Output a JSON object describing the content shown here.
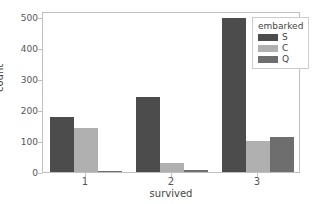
{
  "chart_data": {
    "type": "bar",
    "title": "",
    "xlabel": "survived",
    "ylabel": "count",
    "categories": [
      "1",
      "2",
      "3"
    ],
    "series": [
      {
        "name": "S",
        "color": "#4c4c4c",
        "values": [
          178,
          242,
          496
        ]
      },
      {
        "name": "C",
        "color": "#b0b0b0",
        "values": [
          141,
          29,
          100
        ]
      },
      {
        "name": "Q",
        "color": "#6e6e6e",
        "values": [
          3,
          7,
          112
        ]
      }
    ],
    "legend": {
      "title": "embarked",
      "position": "upper right",
      "entries": [
        "S",
        "C",
        "Q"
      ]
    },
    "ylim": [
      0,
      520
    ],
    "yticks": [
      0,
      100,
      200,
      300,
      400,
      500
    ],
    "ytick_labels": [
      "0",
      "100",
      "200",
      "300",
      "400",
      "500"
    ],
    "xtick_labels": [
      "1",
      "2",
      "3"
    ],
    "grid": false,
    "axes_color": "#bfbfbf",
    "background": "#ffffff"
  }
}
